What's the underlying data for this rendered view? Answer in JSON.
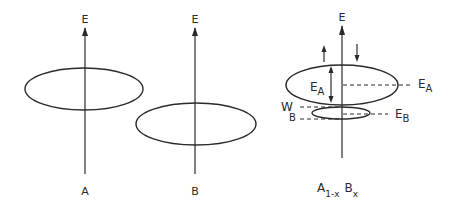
{
  "panels": [
    {
      "axis_label": "E",
      "caption": "A"
    },
    {
      "axis_label": "E",
      "caption": "B"
    },
    {
      "axis_label": "E",
      "caption_main": "A",
      "caption_sub1": "1-x",
      "caption_mid": "B",
      "caption_sub2": "x",
      "inner_label": "E",
      "inner_label_sub": "A",
      "right_label_a": "E",
      "right_label_a_sub": "A",
      "right_label_b": "E",
      "right_label_b_sub": "B",
      "width_label": "W",
      "width_label_sub": "B"
    }
  ],
  "colors": {
    "ink": "#2a2a2a",
    "background": "#ffffff"
  }
}
